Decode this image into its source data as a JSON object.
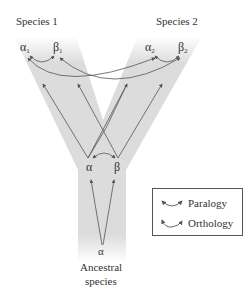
{
  "diagram": {
    "species_labels": {
      "species1": "Species 1",
      "species2": "Species 2",
      "ancestral_line1": "Ancestral",
      "ancestral_line2": "species"
    },
    "genes": {
      "alpha1": {
        "symbol": "α",
        "sub": "1"
      },
      "beta1": {
        "symbol": "β",
        "sub": "1"
      },
      "alpha2": {
        "symbol": "α",
        "sub": "2"
      },
      "beta2": {
        "symbol": "β",
        "sub": "2"
      },
      "alpha_dup": {
        "symbol": "α"
      },
      "beta_dup": {
        "symbol": "β"
      },
      "alpha_ancestral": {
        "symbol": "α"
      }
    },
    "relationships": [
      {
        "from": "α1",
        "to": "β1",
        "type": "Paralogy"
      },
      {
        "from": "α2",
        "to": "β2",
        "type": "Paralogy"
      },
      {
        "from": "α",
        "to": "β",
        "type": "Paralogy"
      },
      {
        "from": "α1",
        "to": "α2",
        "type": "Orthology"
      },
      {
        "from": "β1",
        "to": "β2",
        "type": "Orthology"
      }
    ],
    "legend": {
      "paralogy": "Paralogy",
      "orthology": "Orthology"
    },
    "colors": {
      "tree_band": "#dcdcdc",
      "lines": "#555555",
      "text": "#333333"
    }
  }
}
